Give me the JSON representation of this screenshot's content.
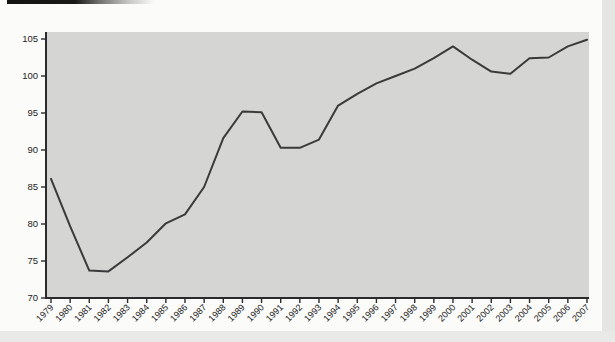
{
  "figure": {
    "title": "",
    "style": {
      "page_bg": "#fbfbfa",
      "plot_bg": "#d5d5d3",
      "line_color": "#3a3a3a",
      "axis_color": "#2b2b2b",
      "tick_label_color": "#1c1c1c",
      "page_edge_color": "#e5e5e3",
      "scan_bar_color": "#161616"
    }
  },
  "chart_data": {
    "type": "line",
    "title": "",
    "xlabel": "",
    "ylabel": "",
    "x": [
      1979,
      1980,
      1981,
      1982,
      1983,
      1984,
      1985,
      1986,
      1987,
      1988,
      1989,
      1990,
      1991,
      1992,
      1993,
      1994,
      1995,
      1996,
      1997,
      1998,
      1999,
      2000,
      2001,
      2002,
      2003,
      2004,
      2005,
      2006,
      2007
    ],
    "series": [
      {
        "name": "index-line",
        "values": [
          86.1,
          79.7,
          73.7,
          73.6,
          75.5,
          77.5,
          80.1,
          81.3,
          85.0,
          91.6,
          95.2,
          95.1,
          90.3,
          90.3,
          91.4,
          96.0,
          97.6,
          99.0,
          100.0,
          101.0,
          102.4,
          104.0,
          102.2,
          100.6,
          100.3,
          102.4,
          102.5,
          104.0,
          104.9
        ]
      }
    ],
    "ylim": [
      70,
      105
    ],
    "y_ticks": [
      70,
      75,
      80,
      85,
      90,
      95,
      100,
      105
    ],
    "x_tick_labels": [
      "1979",
      "1980",
      "1981",
      "1982",
      "1983",
      "1984",
      "1985",
      "1986",
      "1987",
      "1988",
      "1989",
      "1990",
      "1991",
      "1992",
      "1993",
      "1994",
      "1995",
      "1996",
      "1997",
      "1998",
      "1999",
      "2000",
      "2001",
      "2002",
      "2003",
      "2004",
      "2005",
      "2006",
      "2007"
    ],
    "grid": false,
    "legend": "none",
    "x_label_rotation_deg": -45
  }
}
